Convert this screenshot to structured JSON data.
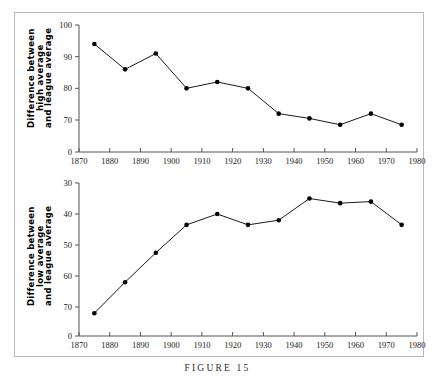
{
  "figure": {
    "caption": "FIGURE 15"
  },
  "chart_data": [
    {
      "type": "line",
      "id": "top",
      "title": "",
      "xlabel": "",
      "ylabel": "Difference between high average and league average",
      "ylabel_lines": [
        "Difference between",
        "high average",
        "and league average"
      ],
      "x": [
        1875,
        1885,
        1895,
        1905,
        1915,
        1925,
        1935,
        1945,
        1955,
        1965,
        1975
      ],
      "values": [
        94,
        86,
        91,
        80,
        82,
        80,
        72,
        70.5,
        68.5,
        72,
        68.5
      ],
      "xlim": [
        1870,
        1980
      ],
      "xticks": [
        1870,
        1880,
        1890,
        1900,
        1910,
        1920,
        1930,
        1940,
        1950,
        1960,
        1970,
        1980
      ],
      "xticklabels": [
        "1870",
        "1880",
        "1890",
        "1900",
        "1910",
        "1920",
        "1930",
        "1940",
        "1950",
        "1960",
        "1970",
        "1980"
      ],
      "ylim": [
        70,
        100
      ],
      "yticks": [
        70,
        80,
        90,
        100
      ],
      "yticklabels": [
        "70",
        "80",
        "90",
        "100"
      ],
      "y_origin_label": "0",
      "y_inverted": false,
      "grid": false,
      "legend": "none",
      "marker": "filled-circle",
      "line_color": "#000000",
      "marker_color": "#000000"
    },
    {
      "type": "line",
      "id": "bottom",
      "title": "",
      "xlabel": "",
      "ylabel": "Difference between low average and league average",
      "ylabel_lines": [
        "Difference between",
        "low average",
        "and league average"
      ],
      "x": [
        1875,
        1885,
        1895,
        1905,
        1915,
        1925,
        1935,
        1945,
        1955,
        1965,
        1975
      ],
      "values": [
        72,
        62,
        52.5,
        43.5,
        40,
        43.5,
        42,
        35,
        36.5,
        36,
        43.5
      ],
      "xlim": [
        1870,
        1980
      ],
      "xticks": [
        1870,
        1880,
        1890,
        1900,
        1910,
        1920,
        1930,
        1940,
        1950,
        1960,
        1970,
        1980
      ],
      "xticklabels": [
        "1870",
        "1880",
        "1890",
        "1900",
        "1910",
        "1920",
        "1930",
        "1940",
        "1950",
        "1960",
        "1970",
        "1980"
      ],
      "ylim": [
        30,
        70
      ],
      "yticks": [
        30,
        40,
        50,
        60,
        70
      ],
      "yticklabels": [
        "30",
        "40",
        "50",
        "60",
        "70"
      ],
      "y_origin_label": "0",
      "y_inverted": true,
      "grid": false,
      "legend": "none",
      "marker": "filled-circle",
      "line_color": "#000000",
      "marker_color": "#000000"
    }
  ]
}
